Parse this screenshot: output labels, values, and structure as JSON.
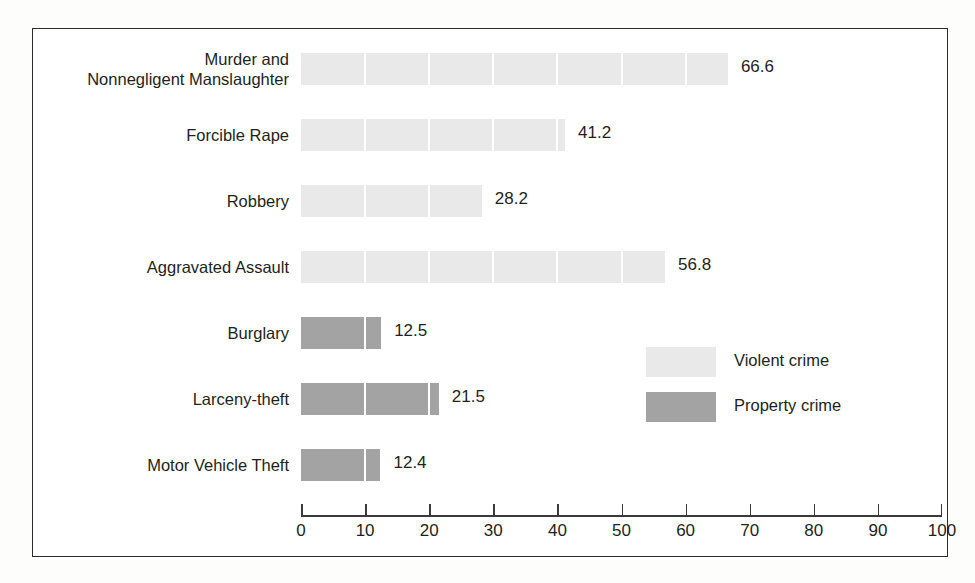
{
  "chart_data": {
    "type": "bar",
    "orientation": "horizontal",
    "title": "",
    "subtitle": "",
    "xlabel": "",
    "ylabel": "",
    "xlim": [
      0,
      100
    ],
    "xticks": [
      0,
      10,
      20,
      30,
      40,
      50,
      60,
      70,
      80,
      90,
      100
    ],
    "xtick_labels": [
      "0",
      "10",
      "20",
      "30",
      "40",
      "50",
      "60",
      "70",
      "80",
      "90",
      "100"
    ],
    "grid": false,
    "segment_interval": 10,
    "categories": [
      "Murder and\nNonnegligent Manslaughter",
      "Forcible Rape",
      "Robbery",
      "Aggravated Assault",
      "Burglary",
      "Larceny-theft",
      "Motor Vehicle Theft"
    ],
    "values": [
      66.6,
      41.2,
      28.2,
      56.8,
      12.5,
      21.5,
      12.4
    ],
    "value_labels": [
      "66.6",
      "41.2",
      "28.2",
      "56.8",
      "12.5",
      "21.5",
      "12.4"
    ],
    "groups": [
      "Violent crime",
      "Violent crime",
      "Violent crime",
      "Violent crime",
      "Property crime",
      "Property crime",
      "Property crime"
    ],
    "legend": {
      "position": "middle-right",
      "entries": [
        {
          "label": "Violent crime",
          "color": "#e9e9e9"
        },
        {
          "label": "Property crime",
          "color": "#a3a3a3"
        }
      ]
    },
    "colors": {
      "violent_crime": "#e9e9e9",
      "property_crime": "#a3a3a3",
      "axis": "#3a3a3a",
      "text": "#231f20",
      "frame": "#2b2b2b",
      "background": "#ffffff"
    }
  }
}
